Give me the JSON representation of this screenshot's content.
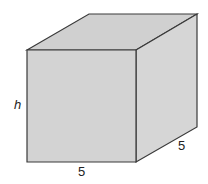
{
  "diagram": {
    "type": "cube",
    "colors": {
      "front_face": "#d3d3d3",
      "top_face": "#d0d0d0",
      "side_face": "#d6d6d6",
      "stroke": "#3a3a3a",
      "label": "#222222"
    },
    "labels": {
      "height": "h",
      "width": "5",
      "depth": "5"
    }
  }
}
